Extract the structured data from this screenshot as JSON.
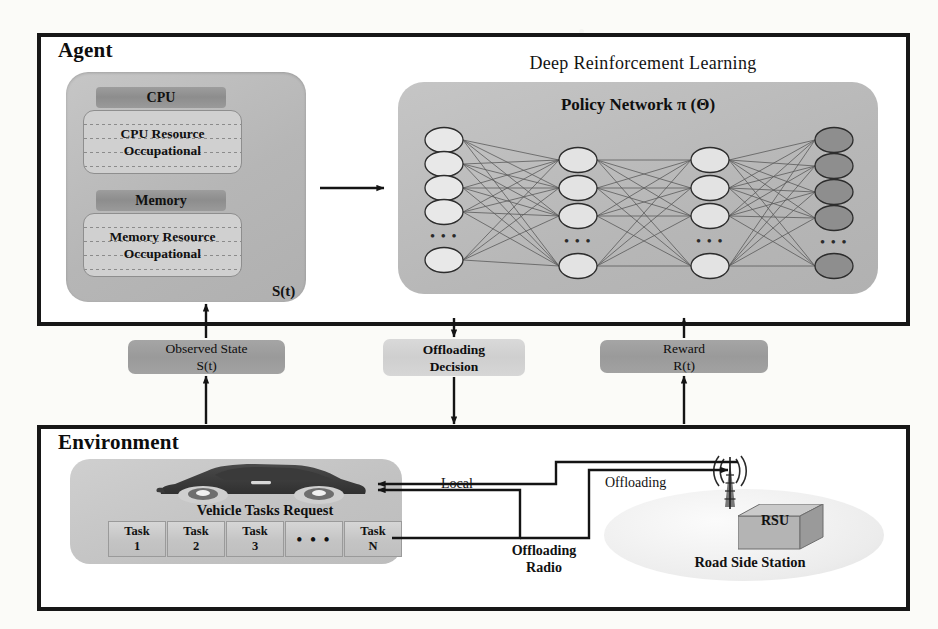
{
  "figure": {
    "agent": {
      "frame_title": "Agent",
      "drl_title": "Deep Reinforcement Learning",
      "state_panel": {
        "cpu_header": "CPU",
        "cpu_resource_line1": "CPU Resource",
        "cpu_resource_line2": "Occupational",
        "memory_header": "Memory",
        "memory_resource_line1": "Memory Resource",
        "memory_resource_line2": "Occupational",
        "state_label": "S(t)"
      },
      "policy_network": {
        "title": "Policy Network π (Θ)",
        "layers": [
          {
            "name": "input",
            "nodes": 6,
            "fill": "#e8e8e8",
            "ellipsis_after": 5
          },
          {
            "name": "hidden1",
            "nodes": 5,
            "fill": "#e3e3e3",
            "ellipsis_after": 4
          },
          {
            "name": "hidden2",
            "nodes": 5,
            "fill": "#e3e3e3",
            "ellipsis_after": 4
          },
          {
            "name": "output",
            "nodes": 5,
            "fill": "#8e8e8e",
            "ellipsis_after": 4
          }
        ],
        "ellipsis_glyph": "• • •"
      }
    },
    "signals": [
      {
        "id": "observed-state",
        "line1": "Observed  State",
        "line2": "S(t)",
        "tone": "dark"
      },
      {
        "id": "offloading-decision",
        "line1": "Offloading",
        "line2": "Decision",
        "tone": "light"
      },
      {
        "id": "reward",
        "line1": "Reward",
        "line2": "R(t)",
        "tone": "dark"
      }
    ],
    "environment": {
      "frame_title": "Environment",
      "vehicle_label": "Vehicle Tasks  Request",
      "tasks": [
        {
          "line1": "Task",
          "line2": "1"
        },
        {
          "line1": "Task",
          "line2": "2"
        },
        {
          "line1": "Task",
          "line2": "3"
        },
        {
          "line1": "• • •",
          "line2": ""
        },
        {
          "line1": "Task",
          "line2": "N"
        }
      ],
      "rsu": {
        "box_label": "RSU",
        "caption": "Road Side Station"
      },
      "wire_labels": {
        "local": "Local",
        "offloading": "Offloading",
        "offloading_radio_line1": "Offloading",
        "offloading_radio_line2": "Radio"
      }
    },
    "colors": {
      "frame_stroke": "#171717",
      "panel_gray": "#bdbdbd",
      "signal_dark": "#9d9d9d",
      "signal_light": "#d4d4d4",
      "output_node": "#8e8e8e",
      "input_node": "#e8e8e8",
      "page_background": "#fbfbf8"
    }
  }
}
